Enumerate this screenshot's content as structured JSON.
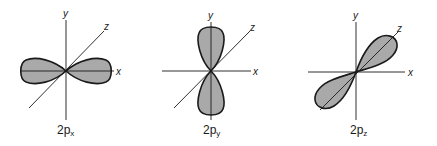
{
  "diagram": {
    "colors": {
      "lobe_fill": "#a9a9a9",
      "lobe_stroke": "#1a1a1a",
      "axis": "#1a1a1a",
      "background": "#ffffff"
    },
    "orbitals": [
      {
        "name": "2px",
        "label_main": "2p",
        "label_sub": "x",
        "axes": {
          "x": "x",
          "y": "y",
          "z": "z"
        },
        "lobe_direction": "x"
      },
      {
        "name": "2py",
        "label_main": "2p",
        "label_sub": "y",
        "axes": {
          "x": "x",
          "y": "y",
          "z": "z"
        },
        "lobe_direction": "y"
      },
      {
        "name": "2pz",
        "label_main": "2p",
        "label_sub": "z",
        "axes": {
          "x": "x",
          "y": "y",
          "z": "z"
        },
        "lobe_direction": "z"
      }
    ]
  }
}
